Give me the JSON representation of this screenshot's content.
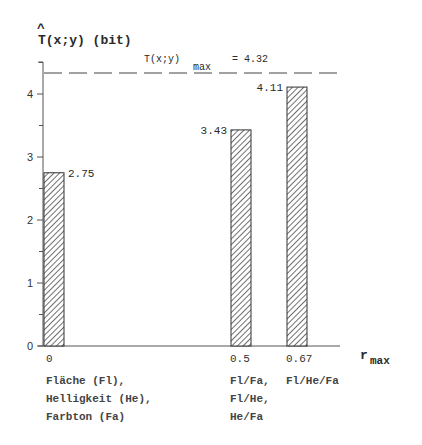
{
  "chart_data": {
    "type": "bar",
    "title": "T(x;y) (bit)",
    "title_hat": "^",
    "ylabel": "T(x;y) (bit)",
    "xlabel": "r",
    "xlabel_sub": "max",
    "ylim": [
      0,
      4.5
    ],
    "yticks": [
      0,
      1,
      2,
      3,
      4
    ],
    "grid": false,
    "categories": [
      "0",
      "0.5",
      "0.67"
    ],
    "values": [
      2.75,
      3.43,
      4.11
    ],
    "value_labels": [
      "2.75",
      "3.43",
      "4.11"
    ],
    "category_descriptions": [
      [
        "Fläche (Fl),",
        "Helligkeit (He),",
        "Farbton (Fa)"
      ],
      [
        "Fl/Fa,",
        "Fl/He,",
        "He/Fa"
      ],
      [
        "Fl/He/Fa"
      ]
    ],
    "reference_line": {
      "value": 4.32,
      "style": "dashed",
      "label_main": "T(x;y)",
      "label_sub": "max",
      "label_value": "= 4.32"
    },
    "bar_fill": "hatched",
    "colors": {
      "ink": "#2a2a2a",
      "axis": "#555555"
    }
  }
}
